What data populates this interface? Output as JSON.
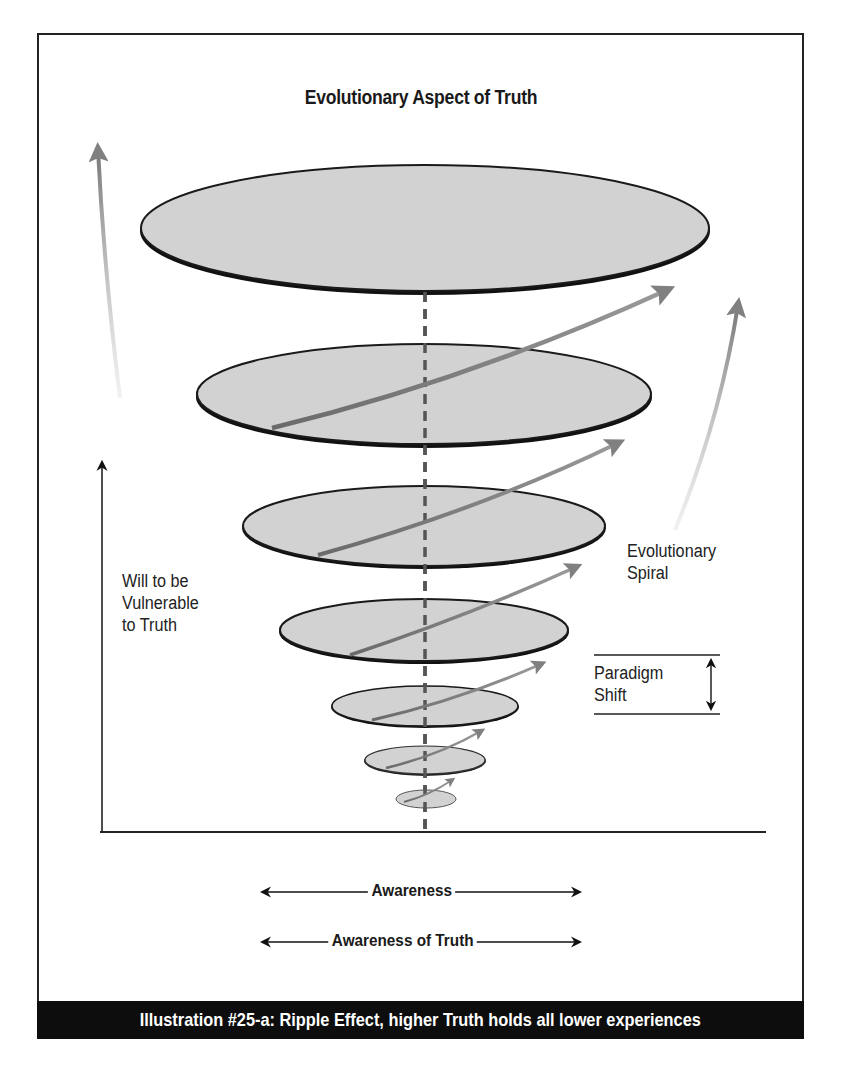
{
  "title": "Evolutionary Aspect of Truth",
  "labels": {
    "vertical_axis": [
      "Will to be",
      "Vulnerable",
      "to Truth"
    ],
    "spiral": [
      "Evolutionary",
      "Spiral"
    ],
    "paradigm_shift": [
      "Paradigm",
      "Shift"
    ],
    "awareness": "Awareness",
    "awareness_of_truth": "Awareness of Truth"
  },
  "caption": "Illustration #25-a: Ripple Effect, higher Truth holds all lower experiences",
  "colors": {
    "ellipse_fill": "#d2d2d2",
    "ellipse_stroke": "#1a1a1a",
    "arrow_gray": "#8a8a8a",
    "dashed_axis": "#555555",
    "caption_bg": "#0d0d0d"
  },
  "ellipses": [
    {
      "level": 1,
      "cx": 425,
      "cy": 228,
      "rx": 285,
      "ry": 64
    },
    {
      "level": 2,
      "cx": 424,
      "cy": 394,
      "rx": 228,
      "ry": 51
    },
    {
      "level": 3,
      "cx": 424,
      "cy": 526,
      "rx": 182,
      "ry": 41
    },
    {
      "level": 4,
      "cx": 424,
      "cy": 630,
      "rx": 145,
      "ry": 32
    },
    {
      "level": 5,
      "cx": 425,
      "cy": 706,
      "rx": 94,
      "ry": 21
    },
    {
      "level": 6,
      "cx": 425,
      "cy": 760,
      "rx": 61,
      "ry": 15
    },
    {
      "level": 7,
      "cx": 426,
      "cy": 799,
      "rx": 30,
      "ry": 9
    }
  ]
}
